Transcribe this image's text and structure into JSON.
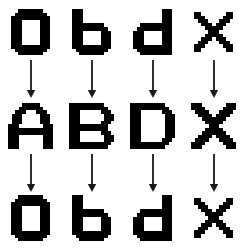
{
  "diagram": {
    "type": "transformation-sequence",
    "background_color": "#ffffff",
    "glyph_color": "#000000",
    "arrow_color": "#1a1a1a",
    "columns": 4,
    "rows": [
      {
        "name": "row-1-lowercase",
        "case": "lowercase",
        "top": 8,
        "height": 48,
        "cells": [
          {
            "label": "a",
            "glyph_name": "glyph-lowercase-a",
            "cols": 11,
            "pixel": 3.6,
            "bitmap": [
              "00111111100",
              "01111111110",
              "11111111111",
              "11100000111",
              "11100000111",
              "11100000111",
              "11100000111",
              "11100000111",
              "11100000111",
              "11100000111",
              "11111111111",
              "01111111110",
              "00111111100"
            ]
          },
          {
            "label": "b",
            "glyph_name": "glyph-lowercase-b",
            "cols": 11,
            "pixel": 3.6,
            "bitmap": [
              "11100000000",
              "11100000000",
              "11100000000",
              "11100000000",
              "11111111100",
              "11111111110",
              "11100000111",
              "11100000111",
              "11100000111",
              "11100000111",
              "11111111111",
              "01111111110",
              "00111111100"
            ]
          },
          {
            "label": "d",
            "glyph_name": "glyph-lowercase-d",
            "cols": 11,
            "pixel": 3.6,
            "bitmap": [
              "00000000111",
              "00000000111",
              "00000000111",
              "00000000111",
              "00111111111",
              "01111111111",
              "11100000111",
              "11100000111",
              "11100000111",
              "11100000111",
              "11111111111",
              "01111111111",
              "00111111111"
            ]
          },
          {
            "label": "X",
            "glyph_name": "glyph-letter-x-small",
            "cols": 11,
            "pixel": 3.6,
            "bitmap": [
              "11000000011",
              "11100000111",
              "01110001110",
              "00111011100",
              "00011111000",
              "00001110000",
              "00011111000",
              "00111011100",
              "01110001110",
              "11100000111",
              "11000000011"
            ]
          }
        ]
      },
      {
        "name": "row-2-uppercase",
        "case": "uppercase",
        "top": 100,
        "height": 52,
        "cells": [
          {
            "label": "A",
            "glyph_name": "glyph-uppercase-a",
            "cols": 13,
            "pixel": 3.5,
            "bitmap": [
              "0000111110000",
              "0001111111000",
              "0011100011100",
              "0111000001110",
              "0111000001110",
              "0111000001110",
              "1110000000111",
              "1111111111111",
              "1111111111111",
              "1110000000111",
              "1110000000111",
              "1110000000111",
              "1110000000111"
            ]
          },
          {
            "label": "B",
            "glyph_name": "glyph-uppercase-b",
            "cols": 13,
            "pixel": 3.5,
            "bitmap": [
              "1111111111000",
              "1111111111100",
              "1110000001110",
              "1110000000111",
              "1110000000111",
              "1110000001110",
              "1111111111100",
              "1111111111100",
              "1110000001110",
              "1110000000111",
              "1110000000111",
              "1111111111110",
              "1111111111100"
            ]
          },
          {
            "label": "D",
            "glyph_name": "glyph-uppercase-d",
            "cols": 13,
            "pixel": 3.5,
            "bitmap": [
              "1111111111000",
              "1111111111100",
              "1110000001110",
              "1110000000111",
              "1110000000111",
              "1110000000111",
              "1110000000111",
              "1110000000111",
              "1110000000111",
              "1110000000111",
              "1110000001110",
              "1111111111100",
              "1111111111000"
            ]
          },
          {
            "label": "X",
            "glyph_name": "glyph-uppercase-x",
            "cols": 13,
            "pixel": 3.5,
            "bitmap": [
              "1110000000111",
              "1111000001111",
              "0111100011110",
              "0011110111100",
              "0001111111000",
              "0000111110000",
              "0000011100000",
              "0000111110000",
              "0001111111000",
              "0011110111100",
              "0111100011110",
              "1111000001111",
              "1110000000111"
            ]
          }
        ]
      },
      {
        "name": "row-3-lowercase",
        "case": "lowercase",
        "top": 194,
        "height": 48,
        "cells": [
          {
            "label": "a",
            "glyph_name": "glyph-lowercase-a",
            "cols": 11,
            "pixel": 3.6,
            "bitmap": [
              "00111111100",
              "01111111110",
              "11111111111",
              "11100000111",
              "11100000111",
              "11100000111",
              "11100000111",
              "11100000111",
              "11100000111",
              "11100000111",
              "11111111111",
              "01111111110",
              "00111111100"
            ]
          },
          {
            "label": "b",
            "glyph_name": "glyph-lowercase-b",
            "cols": 11,
            "pixel": 3.6,
            "bitmap": [
              "11100000000",
              "11100000000",
              "11100000000",
              "11100000000",
              "11111111100",
              "11111111110",
              "11100000111",
              "11100000111",
              "11100000111",
              "11100000111",
              "11111111111",
              "01111111110",
              "00111111100"
            ]
          },
          {
            "label": "d",
            "glyph_name": "glyph-lowercase-d",
            "cols": 11,
            "pixel": 3.6,
            "bitmap": [
              "00000000111",
              "00000000111",
              "00000000111",
              "00000000111",
              "00111111111",
              "01111111111",
              "11100000111",
              "11100000111",
              "11100000111",
              "11100000111",
              "11111111111",
              "01111111111",
              "00111111111"
            ]
          },
          {
            "label": "X",
            "glyph_name": "glyph-letter-x-small",
            "cols": 11,
            "pixel": 3.6,
            "bitmap": [
              "11000000011",
              "11100000111",
              "01110001110",
              "00111011100",
              "00011111000",
              "00001110000",
              "00011111000",
              "00111011100",
              "01110001110",
              "11100000111",
              "11000000011"
            ]
          }
        ]
      }
    ],
    "arrow_rows": [
      {
        "name": "arrow-row-1",
        "top": 60,
        "height": 38,
        "direction": "down",
        "count": 4
      },
      {
        "name": "arrow-row-2",
        "top": 154,
        "height": 38,
        "direction": "down",
        "count": 4
      }
    ]
  }
}
